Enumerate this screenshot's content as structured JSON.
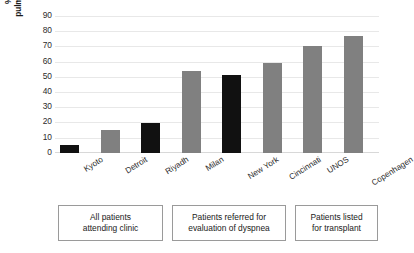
{
  "chart_data": {
    "type": "bar",
    "title": "",
    "xlabel": "",
    "ylabel": "% of patients with pulmonary hypertension",
    "ylabel_lines": [
      "% of patients with",
      "pulmonary hypertension"
    ],
    "categories": [
      "Kyoto",
      "Detroit",
      "Riyadh",
      "Milan",
      "New York",
      "Cincinnati",
      "UNOS",
      "Copenhagen"
    ],
    "values": [
      5,
      15,
      20,
      54,
      51,
      59,
      70,
      77
    ],
    "bar_colors": [
      "#111111",
      "#808080",
      "#111111",
      "#808080",
      "#111111",
      "#808080",
      "#808080",
      "#808080"
    ],
    "ylim": [
      0,
      90
    ],
    "yticks": [
      0,
      10,
      20,
      30,
      40,
      50,
      60,
      70,
      80,
      90
    ],
    "ytick_labels": [
      "0",
      "10",
      "20",
      "30",
      "40",
      "50",
      "60",
      "70",
      "80",
      "90"
    ],
    "grid": true,
    "legend": "none",
    "series": [
      {
        "name": "% of patients with pulmonary hypertension",
        "values": [
          5,
          15,
          20,
          54,
          51,
          59,
          70,
          77
        ]
      }
    ],
    "annotations": [
      {
        "label_lines": [
          "All patients",
          "attending clinic"
        ],
        "covers": [
          "Kyoto",
          "Detroit",
          "Riyadh"
        ]
      },
      {
        "label_lines": [
          "Patients referred for",
          "evaluation of dyspnea"
        ],
        "covers": [
          "Milan",
          "New York",
          "Cincinnati"
        ]
      },
      {
        "label_lines": [
          "Patients listed",
          "for transplant"
        ],
        "covers": [
          "UNOS",
          "Copenhagen"
        ]
      }
    ]
  },
  "groups": [
    {
      "line1": "All patients",
      "line2": "attending clinic"
    },
    {
      "line1": "Patients referred for",
      "line2": "evaluation of dyspnea"
    },
    {
      "line1": "Patients listed",
      "line2": "for transplant"
    }
  ],
  "colors": {
    "bar_dark": "#111111",
    "bar_gray": "#808080",
    "gridline": "#e8e8e8",
    "text": "#2b2b2b",
    "box_border": "#9a9a9a",
    "background": "#ffffff"
  }
}
